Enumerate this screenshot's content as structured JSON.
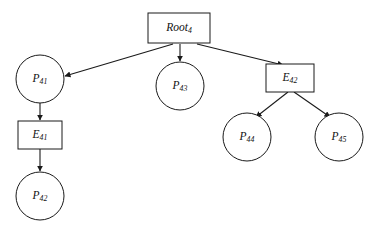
{
  "diagram": {
    "type": "tree",
    "title": "",
    "background_color": "#ffffff",
    "stroke_color": "#1a1a1a",
    "fill_color": "#ffffff",
    "nodes": [
      {
        "id": "root4",
        "label_base": "Root",
        "label_sub": "4",
        "shape": "rectangle",
        "x": 179,
        "y": 28,
        "width": 62,
        "height": 30
      },
      {
        "id": "p41",
        "label_base": "P",
        "label_sub": "41",
        "shape": "circle",
        "x": 40,
        "y": 79,
        "radius": 24
      },
      {
        "id": "e41",
        "label_base": "E",
        "label_sub": "41",
        "shape": "rectangle",
        "x": 40,
        "y": 135,
        "width": 44,
        "height": 28
      },
      {
        "id": "p42",
        "label_base": "P",
        "label_sub": "42",
        "shape": "circle",
        "x": 40,
        "y": 196,
        "radius": 24
      },
      {
        "id": "p43",
        "label_base": "P",
        "label_sub": "43",
        "shape": "circle",
        "x": 180,
        "y": 86,
        "radius": 24
      },
      {
        "id": "e42",
        "label_base": "E",
        "label_sub": "42",
        "shape": "rectangle",
        "x": 290,
        "y": 78,
        "width": 48,
        "height": 28
      },
      {
        "id": "p44",
        "label_base": "P",
        "label_sub": "44",
        "shape": "circle",
        "x": 247,
        "y": 137,
        "radius": 24
      },
      {
        "id": "p45",
        "label_base": "P",
        "label_sub": "45",
        "shape": "circle",
        "x": 339,
        "y": 137,
        "radius": 24
      }
    ],
    "edges": [
      {
        "id": "root4-p41",
        "from": "root4",
        "to": "p41",
        "x1": 173,
        "y1": 44,
        "x2": 65,
        "y2": 76,
        "arrowhead": true
      },
      {
        "id": "root4-p43",
        "from": "root4",
        "to": "p43",
        "x1": 180,
        "y1": 44,
        "x2": 180,
        "y2": 61,
        "arrowhead": true
      },
      {
        "id": "root4-e42",
        "from": "root4",
        "to": "e42",
        "x1": 197,
        "y1": 44,
        "x2": 283,
        "y2": 65,
        "arrowhead": true
      },
      {
        "id": "p41-e41",
        "from": "p41",
        "to": "e41",
        "x1": 40,
        "y1": 103,
        "x2": 40,
        "y2": 120,
        "arrowhead": true
      },
      {
        "id": "e41-p42",
        "from": "e41",
        "to": "p42",
        "x1": 40,
        "y1": 149,
        "x2": 40,
        "y2": 171,
        "arrowhead": true
      },
      {
        "id": "e42-p44",
        "from": "e42",
        "to": "p44",
        "x1": 288,
        "y1": 92,
        "x2": 256,
        "y2": 117,
        "arrowhead": true
      },
      {
        "id": "e42-p45",
        "from": "e42",
        "to": "p45",
        "x1": 294,
        "y1": 92,
        "x2": 330,
        "y2": 117,
        "arrowhead": true
      }
    ]
  }
}
